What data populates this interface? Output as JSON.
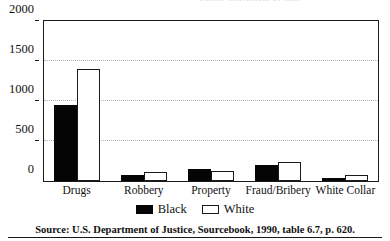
{
  "chart_data": {
    "type": "bar",
    "title": "",
    "title_remnant": "Felony Convictions by Race",
    "xlabel": "",
    "ylabel": "",
    "ylim": [
      0,
      2000
    ],
    "yticks": [
      0,
      500,
      1000,
      1500,
      2000
    ],
    "ytick_labels": [
      "0",
      "500",
      "1000",
      "1500",
      "2000"
    ],
    "grid": true,
    "grid_axis": "y",
    "legend_position": "bottom-center",
    "categories": [
      "Drugs",
      "Robbery",
      "Property",
      "Fraud/Bribery",
      "White Collar"
    ],
    "series": [
      {
        "name": "Black",
        "color": "#050505",
        "fill": "solid",
        "values": [
          950,
          75,
          150,
          200,
          40
        ]
      },
      {
        "name": "White",
        "color": "#ffffff",
        "fill": "outlined",
        "edge_color": "#1a1a1a",
        "values": [
          1400,
          110,
          125,
          235,
          75
        ]
      }
    ],
    "source": "Source: U.S. Department of Justice, Sourcebook, 1990, table 6.7, p. 620."
  },
  "legend": {
    "entries": [
      {
        "label": "Black",
        "style": "black"
      },
      {
        "label": "White",
        "style": "white"
      }
    ]
  },
  "caption": {
    "source_text": "Source: U.S. Department of Justice, Sourcebook, 1990, table 6.7, p. 620."
  },
  "colors": {
    "black_series": "#050505",
    "white_series": "#ffffff",
    "frame": "#1a1a1a",
    "gridline": "#b4b4b4",
    "text": "#111111",
    "background": "#ffffff"
  }
}
